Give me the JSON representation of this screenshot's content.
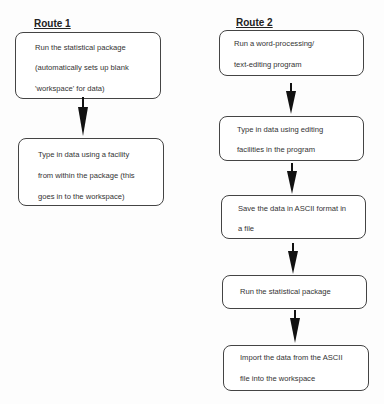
{
  "route1": {
    "title": "Route 1",
    "steps": [
      {
        "lines": [
          "Run the statistical package",
          "(automatically sets up blank",
          "'workspace' for data)"
        ]
      },
      {
        "lines": [
          "Type in data using a facility",
          "from within the package (this",
          "goes in to the workspace)"
        ]
      }
    ]
  },
  "route2": {
    "title": "Route 2",
    "steps": [
      {
        "lines": [
          "Run a word-processing/",
          "text-editing program"
        ]
      },
      {
        "lines": [
          "Type in data using editing",
          "facilities in the program"
        ]
      },
      {
        "lines": [
          "Save the data in ASCII format in",
          "a file"
        ]
      },
      {
        "lines": [
          "Run the statistical package"
        ]
      },
      {
        "lines": [
          "Import the data from the ASCII",
          "file into the workspace"
        ]
      }
    ]
  }
}
